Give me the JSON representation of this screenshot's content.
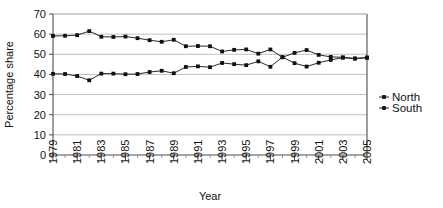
{
  "chart_data": {
    "type": "line",
    "title": "",
    "xlabel": "Year",
    "ylabel": "Percentage share",
    "xlim": [
      1979,
      2005
    ],
    "ylim": [
      0,
      70
    ],
    "ytick_step": 10,
    "yticks": [
      0,
      10,
      20,
      30,
      40,
      50,
      60,
      70
    ],
    "xticks": [
      1979,
      1981,
      1983,
      1985,
      1987,
      1989,
      1991,
      1993,
      1995,
      1997,
      1999,
      2001,
      2003,
      2005
    ],
    "xtick_labels": [
      "1979",
      "1981",
      "1983",
      "1985",
      "1987",
      "1989",
      "1991",
      "1993",
      "1995",
      "1997",
      "1999",
      "2001",
      "2003",
      "2005"
    ],
    "ytick_labels": [
      "0",
      "10",
      "20",
      "30",
      "40",
      "50",
      "60",
      "70"
    ],
    "grid": "horizontal",
    "legend_position": "right",
    "x": [
      1979,
      1980,
      1981,
      1982,
      1983,
      1984,
      1985,
      1986,
      1987,
      1988,
      1989,
      1990,
      1991,
      1992,
      1993,
      1994,
      1995,
      1996,
      1997,
      1998,
      1999,
      2000,
      2001,
      2002,
      2003,
      2004,
      2005
    ],
    "series": [
      {
        "name": "North",
        "marker": "square",
        "color": "#111111",
        "values": [
          40.3,
          40.2,
          39.2,
          37.1,
          40.4,
          40.4,
          40.1,
          40.2,
          41.2,
          41.8,
          40.6,
          43.7,
          44.0,
          43.6,
          45.7,
          45.1,
          44.6,
          46.5,
          43.8,
          48.6,
          45.6,
          43.9,
          45.8,
          47.2,
          48.3,
          47.9,
          48.3
        ]
      },
      {
        "name": "South",
        "marker": "square",
        "color": "#111111",
        "values": [
          59.1,
          59.2,
          59.5,
          61.5,
          58.7,
          58.6,
          58.8,
          58.0,
          57.0,
          56.2,
          57.2,
          54.0,
          54.1,
          54.0,
          51.4,
          52.2,
          52.4,
          50.3,
          52.4,
          48.5,
          50.7,
          52.1,
          49.7,
          48.7,
          48.5,
          47.9,
          48.4
        ]
      }
    ]
  },
  "legend": {
    "items": [
      {
        "label": "North"
      },
      {
        "label": "South"
      }
    ]
  }
}
